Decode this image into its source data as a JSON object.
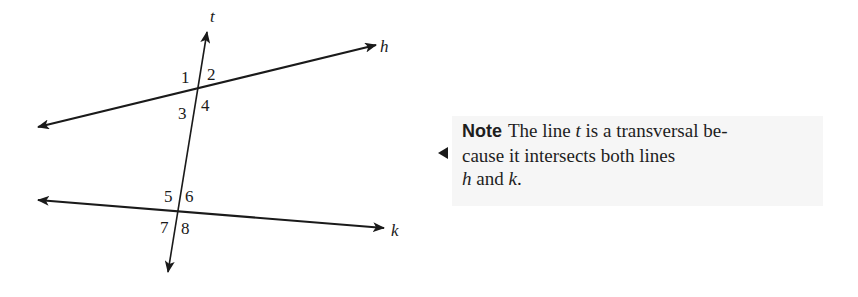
{
  "figure": {
    "type": "transversal-diagram",
    "lines": [
      {
        "name": "t",
        "label": "t",
        "role": "transversal",
        "from": [
          168,
          272
        ],
        "to": [
          207,
          32
        ],
        "arrows": "both",
        "label_pos": [
          210,
          22
        ]
      },
      {
        "name": "h",
        "label": "h",
        "role": "line",
        "from": [
          38,
          127
        ],
        "to": [
          376,
          45
        ],
        "arrows": "both",
        "label_pos": [
          380,
          52
        ]
      },
      {
        "name": "k",
        "label": "k",
        "role": "line",
        "from": [
          38,
          200
        ],
        "to": [
          384,
          228
        ],
        "arrows": "both",
        "label_pos": [
          391,
          236
        ]
      }
    ],
    "angles": [
      {
        "label": "1",
        "pos": [
          181,
          83
        ]
      },
      {
        "label": "2",
        "pos": [
          207,
          80
        ]
      },
      {
        "label": "3",
        "pos": [
          178,
          119
        ]
      },
      {
        "label": "4",
        "pos": [
          201,
          111
        ]
      },
      {
        "label": "5",
        "pos": [
          164,
          202
        ]
      },
      {
        "label": "6",
        "pos": [
          185,
          202
        ]
      },
      {
        "label": "7",
        "pos": [
          160,
          233
        ]
      },
      {
        "label": "8",
        "pos": [
          181,
          234
        ]
      }
    ],
    "stroke_color": "#1a1a1a"
  },
  "note": {
    "heading": "Note",
    "text_1": "The line ",
    "var_t": "t",
    "text_2": " is a transversal be-",
    "line_2": "cause it intersects both lines",
    "var_h": "h",
    "text_3": " and ",
    "var_k": "k",
    "text_4": ".",
    "background": "#f6f6f6"
  }
}
